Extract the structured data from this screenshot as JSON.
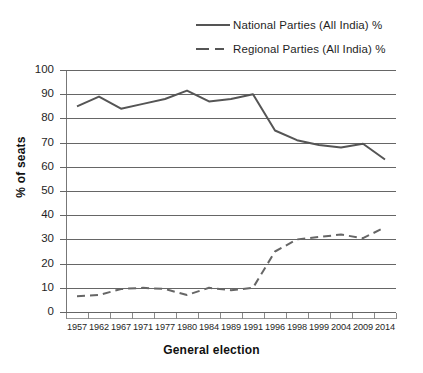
{
  "chart_data": {
    "type": "line",
    "title": "",
    "xlabel": "General election",
    "ylabel": "% of seats",
    "grid": true,
    "legend_position": "top-center",
    "ylim": [
      0,
      100
    ],
    "yticks": [
      0,
      10,
      20,
      30,
      40,
      50,
      60,
      70,
      80,
      90,
      100
    ],
    "categories": [
      "1957",
      "1962",
      "1967",
      "1971",
      "1977",
      "1980",
      "1984",
      "1989",
      "1991",
      "1996",
      "1998",
      "1999",
      "2004",
      "2009",
      "2014"
    ],
    "series": [
      {
        "name": "National Parties (All India) %",
        "style": "solid",
        "color": "#555555",
        "values": [
          85,
          89,
          84,
          86,
          88,
          91.5,
          87,
          88,
          90,
          75,
          71,
          69,
          68,
          69.5,
          63
        ]
      },
      {
        "name": "Regional Parties (All India) %",
        "style": "dashed",
        "color": "#666666",
        "values": [
          6.5,
          7,
          9.5,
          10,
          9.5,
          7,
          10,
          9,
          10,
          25,
          30,
          31,
          32,
          30.5,
          35
        ]
      }
    ]
  },
  "legend": {
    "entries": [
      {
        "label": "National Parties (All India) %",
        "style": "solid"
      },
      {
        "label": "Regional Parties (All India) %",
        "style": "dashed"
      }
    ]
  },
  "axes": {
    "y_title": "% of seats",
    "x_title": "General election",
    "y_tick_labels": [
      "100",
      "90",
      "80",
      "70",
      "60",
      "50",
      "40",
      "30",
      "20",
      "10",
      "0"
    ],
    "x_tick_labels": [
      "1957",
      "1962",
      "1967",
      "1971",
      "1977",
      "1980",
      "1984",
      "1989",
      "1991",
      "1996",
      "1998",
      "1999",
      "2004",
      "2009",
      "2014"
    ]
  }
}
